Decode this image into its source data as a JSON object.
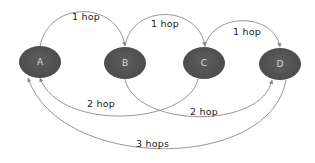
{
  "diagram": {
    "type": "network-hop-diagram",
    "colors": {
      "node_fill": "#4f4f4f",
      "node_text": "#d6d6d6",
      "edge_stroke": "#8a8a8a",
      "label_text": "#222222",
      "background": "#ffffff"
    },
    "nodes": [
      {
        "id": "A",
        "label": "A"
      },
      {
        "id": "B",
        "label": "B"
      },
      {
        "id": "C",
        "label": "C"
      },
      {
        "id": "D",
        "label": "D"
      }
    ],
    "edges": [
      {
        "from": "A",
        "to": "B",
        "label": "1 hop",
        "side": "top"
      },
      {
        "from": "B",
        "to": "C",
        "label": "1 hop",
        "side": "top"
      },
      {
        "from": "C",
        "to": "D",
        "label": "1 hop",
        "side": "top"
      },
      {
        "from": "A",
        "to": "C",
        "label": "2 hop",
        "side": "bottom"
      },
      {
        "from": "B",
        "to": "D",
        "label": "2 hop",
        "side": "bottom"
      },
      {
        "from": "A",
        "to": "D",
        "label": "3 hops",
        "side": "bottom"
      }
    ]
  }
}
